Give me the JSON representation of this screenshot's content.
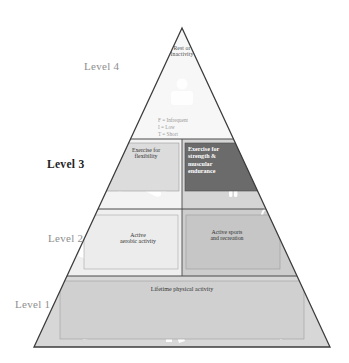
{
  "figure": {
    "type": "physical-activity-pyramid",
    "apex_label": "Rest or\nInactivity",
    "legend": {
      "line1": "F = Infrequent",
      "line2": "I = Low",
      "line3": "T = Short"
    },
    "levels": [
      {
        "id": "level-4",
        "label": "Level 4",
        "emphasis": false
      },
      {
        "id": "level-3",
        "label": "Level 3",
        "emphasis": true
      },
      {
        "id": "level-2",
        "label": "Level 2",
        "emphasis": false
      },
      {
        "id": "level-1",
        "label": "Level 1",
        "emphasis": false
      }
    ],
    "boxes": {
      "flexibility": "Exercise for\nflexibility",
      "strength": "Exercise for\nstrength &\nmuscular\nendurance",
      "aerobic": "Active\naerobic activity",
      "sports": "Active sports\nand recreation",
      "lifetime": "Lifetime physical activity"
    },
    "colors": {
      "outline": "#3c3c3c",
      "band_light": "#f2f2f2",
      "band_shaded": "#c9c9c9",
      "band_base": "#d5d5d5",
      "box_light": "#e0e0e0",
      "box_dark": "#6b6b6b",
      "label_gray": "#8e8e8e",
      "label_dark": "#1d1d1d",
      "figure_silhouette": "#ffffff"
    }
  }
}
